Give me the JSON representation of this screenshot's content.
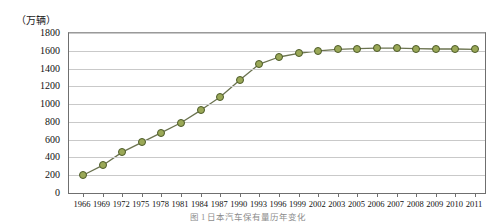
{
  "chart_data": {
    "type": "line",
    "title": "",
    "caption": "图 1  日本汽车保有量历年变化",
    "xlabel": "",
    "ylabel": "（万辆）",
    "unit_note": "（万辆）",
    "ylim": [
      0,
      1800
    ],
    "ytick_step": 200,
    "yticks": [
      0,
      200,
      400,
      600,
      800,
      1000,
      1200,
      1400,
      1600,
      1800
    ],
    "grid": true,
    "legend": "none",
    "categories": [
      "1966",
      "1969",
      "1972",
      "1975",
      "1978",
      "1981",
      "1984",
      "1987",
      "1990",
      "1993",
      "1996",
      "1999",
      "2002",
      "2003",
      "2005",
      "2006",
      "2007",
      "2008",
      "2009",
      "2010",
      "2011"
    ],
    "values": [
      200,
      310,
      460,
      570,
      680,
      790,
      930,
      1080,
      1270,
      1450,
      1530,
      1570,
      1600,
      1615,
      1625,
      1630,
      1630,
      1625,
      1620,
      1620,
      1615
    ],
    "series": [
      {
        "name": "保有量",
        "marker": "circle",
        "marker_fill": "#9aa857",
        "marker_stroke": "#4c5a28",
        "line_color": "#6b7350",
        "values": [
          200,
          310,
          460,
          570,
          680,
          790,
          930,
          1080,
          1270,
          1450,
          1530,
          1570,
          1600,
          1615,
          1625,
          1630,
          1630,
          1625,
          1620,
          1620,
          1615
        ]
      }
    ],
    "colors": {
      "background": "#ffffff",
      "grid": "#c9c9c9",
      "axis": "#6f6f6f",
      "text": "#111111",
      "marker_fill": "#9aa857",
      "marker_stroke": "#4c5a28",
      "line": "#6b7350"
    }
  }
}
